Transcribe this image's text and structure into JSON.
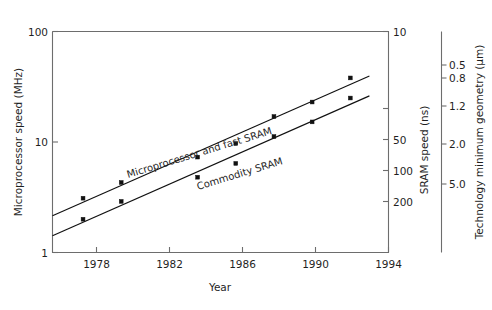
{
  "chart_data": {
    "type": "line",
    "title": "",
    "xlabel": "Year",
    "ylabel": "Microprocessor speed (MHz)",
    "y2label": "SRAM speed (ns)",
    "y3label": "Technology minimum geometry (µm)",
    "xlim": [
      1976.4,
      1994.0
    ],
    "ylim": [
      1,
      100
    ],
    "yscale": "log",
    "xticks": [
      1978,
      1982,
      1986,
      1990,
      1994
    ],
    "xticklabels": [
      "1978",
      "1982",
      "1986",
      "1990",
      "1994"
    ],
    "yticks": [
      1,
      10,
      100
    ],
    "yticklabels": [
      "1",
      "10",
      "100"
    ],
    "y2ticks": [
      10,
      50,
      100,
      200
    ],
    "y2ticklabels": [
      "10",
      "50",
      "100",
      "200"
    ],
    "y3ticks": [
      0.5,
      0.8,
      1.2,
      2.0,
      5.0
    ],
    "y3ticklabels": [
      "0.5",
      "0.8",
      "1.2",
      "2.0",
      "5.0"
    ],
    "grid": false,
    "legend_position": "inline-labels",
    "series": [
      {
        "name": "Microprocessor and fast SRAM",
        "x": [
          1978,
          1980,
          1984,
          1986,
          1988,
          1990,
          1992
        ],
        "values": [
          3.1,
          4.3,
          7.3,
          9.7,
          17.0,
          23.0,
          38.0
        ]
      },
      {
        "name": "Commodity SRAM",
        "x": [
          1978,
          1980,
          1984,
          1986,
          1988,
          1990,
          1992
        ],
        "values": [
          2.0,
          2.9,
          4.8,
          6.4,
          11.2,
          15.2,
          25.0
        ]
      }
    ],
    "annotations": [
      {
        "text": "Microprocessor and fast SRAM",
        "angle": -17
      },
      {
        "text": "Commodity SRAM",
        "angle": -17
      }
    ]
  },
  "axes": {
    "y_left": {
      "title": "Microprocessor speed (MHz)",
      "ticks": [
        {
          "label": "100"
        },
        {
          "label": "10"
        },
        {
          "label": "1"
        }
      ]
    },
    "x_bottom": {
      "title": "Year",
      "ticks": [
        {
          "label": "1978"
        },
        {
          "label": "1982"
        },
        {
          "label": "1986"
        },
        {
          "label": "1990"
        },
        {
          "label": "1994"
        }
      ]
    },
    "y_right_sram": {
      "title": "SRAM speed (ns)",
      "ticks": [
        {
          "label": "10"
        },
        {
          "label": "50"
        },
        {
          "label": "100"
        },
        {
          "label": "200"
        }
      ]
    },
    "y_right_geometry": {
      "title": "Technology minimum geometry (µm)",
      "ticks": [
        {
          "label": "0.5"
        },
        {
          "label": "0.8"
        },
        {
          "label": "1.2"
        },
        {
          "label": "2.0"
        },
        {
          "label": "5.0"
        }
      ]
    }
  },
  "colors": {
    "background": "#ffffff",
    "frame": "#6d6d6d",
    "data": "#111111",
    "text": "#1f1f1f"
  }
}
